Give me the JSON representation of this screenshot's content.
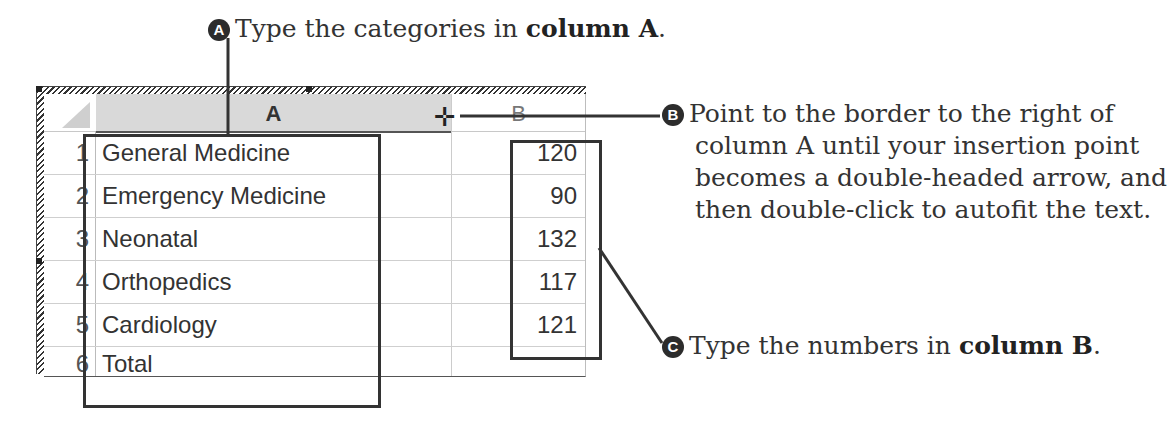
{
  "callouts": {
    "a": {
      "badge": "A",
      "text_prefix": "Type the categories in ",
      "text_bold": "column A",
      "text_suffix": "."
    },
    "b": {
      "badge": "B",
      "lines": [
        "Point to the border to the right of",
        "column A until your insertion point",
        "becomes a double-headed arrow, and",
        "then double-click to autofit the text."
      ]
    },
    "c": {
      "badge": "C",
      "text_prefix": "Type the numbers in ",
      "text_bold": "column B",
      "text_suffix": "."
    }
  },
  "sheet": {
    "columns": [
      "A",
      "B"
    ],
    "rows": [
      {
        "num": "1",
        "a": "General Medicine",
        "b": "120"
      },
      {
        "num": "2",
        "a": "Emergency Medicine",
        "b": "90"
      },
      {
        "num": "3",
        "a": "Neonatal",
        "b": "132"
      },
      {
        "num": "4",
        "a": "Orthopedics",
        "b": "117"
      },
      {
        "num": "5",
        "a": "Cardiology",
        "b": "121"
      },
      {
        "num": "6",
        "a": "Total",
        "b": ""
      }
    ],
    "cursor_glyph": "resize-column-cursor"
  },
  "colors": {
    "ink": "#333333",
    "header_fill": "#d9d9d9",
    "badge": "#2c2c2c"
  }
}
